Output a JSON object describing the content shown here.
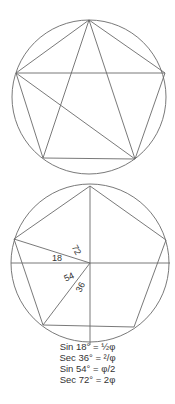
{
  "figures": {
    "top": {
      "description": "Regular pentagon inscribed in a circle with diagonals",
      "circle": {
        "cx": 89,
        "cy": 97,
        "r": 77
      }
    },
    "bottom": {
      "description": "Regular pentagon inscribed in a circle with angle construction",
      "circle": {
        "cx": 90,
        "cy": 263,
        "r": 79
      },
      "angle_labels": [
        "72",
        "18",
        "54",
        "36"
      ]
    }
  },
  "formulas": [
    "Sin 18° = ½φ",
    "Sec 36° = ²/φ",
    "Sin 54° = φ/2",
    "Sec 72° = 2φ"
  ],
  "colors": {
    "line": "#6a6a6a",
    "text": "#333333",
    "background": "#ffffff"
  }
}
